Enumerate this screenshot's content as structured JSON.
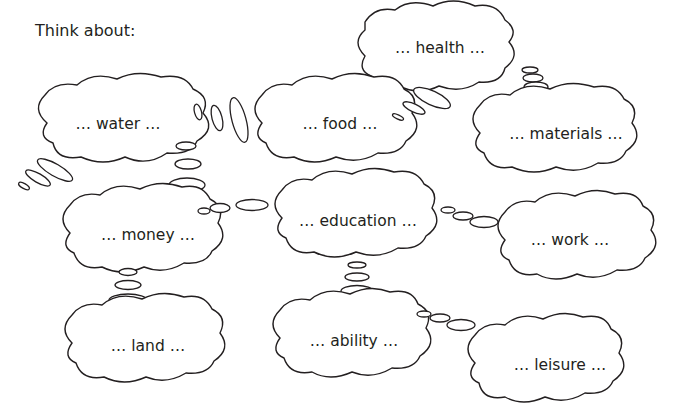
{
  "title": "Think about:",
  "clouds": [
    {
      "id": "health",
      "label": "… health …",
      "cx": 443,
      "cy": 48
    },
    {
      "id": "water",
      "label": "… water …",
      "cx": 120,
      "cy": 124
    },
    {
      "id": "food",
      "label": "… food …",
      "cx": 340,
      "cy": 124
    },
    {
      "id": "materials",
      "label": "… materials …",
      "cx": 572,
      "cy": 134
    },
    {
      "id": "money",
      "label": "… money …",
      "cx": 148,
      "cy": 235
    },
    {
      "id": "education",
      "label": "… education …",
      "cx": 358,
      "cy": 221
    },
    {
      "id": "work",
      "label": "… work …",
      "cx": 573,
      "cy": 240
    },
    {
      "id": "land",
      "label": "… land …",
      "cx": 148,
      "cy": 346
    },
    {
      "id": "ability",
      "label": "… ability …",
      "cx": 354,
      "cy": 341
    },
    {
      "id": "leisure",
      "label": "… leisure …",
      "cx": 560,
      "cy": 365
    }
  ],
  "colors": {
    "stroke": "#231f20",
    "background": "#ffffff"
  }
}
